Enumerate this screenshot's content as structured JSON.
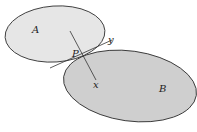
{
  "diagram": {
    "colors": {
      "background": "#ffffff",
      "body_a_fill": "#e6e6e6",
      "body_b_fill": "#cfcfcf",
      "stroke": "#333333",
      "label": "#222222"
    },
    "bodies": [
      {
        "id": "A",
        "label": "A"
      },
      {
        "id": "B",
        "label": "B"
      }
    ],
    "contact_point": {
      "label": "P"
    },
    "axes": {
      "tangent": {
        "label": "y"
      },
      "normal": {
        "label": "x"
      }
    }
  }
}
